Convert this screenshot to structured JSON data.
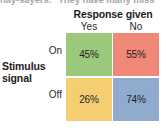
{
  "figure": {
    "clipped_top_text": "nay-sayers.\" They have many miss",
    "column_group_title": "Response given",
    "row_group_title_line1": "Stimulus",
    "row_group_title_line2": "signal",
    "column_labels": [
      "Yes",
      "No"
    ],
    "row_labels": [
      "On",
      "Off"
    ]
  },
  "chart_data": {
    "type": "heatmap",
    "title": "",
    "xlabel": "Response given",
    "ylabel": "Stimulus signal",
    "categories": [
      "Yes",
      "No"
    ],
    "rows": [
      "On",
      "Off"
    ],
    "grid": false,
    "legend": "none",
    "cells": [
      {
        "row": "On",
        "column": "Yes",
        "label": "45%",
        "value": 45,
        "color": "#9BC87A"
      },
      {
        "row": "On",
        "column": "No",
        "label": "55%",
        "value": 55,
        "color": "#F08878"
      },
      {
        "row": "Off",
        "column": "Yes",
        "label": "26%",
        "value": 26,
        "color": "#F5CE72"
      },
      {
        "row": "Off",
        "column": "No",
        "label": "74%",
        "value": 74,
        "color": "#8FABCE"
      }
    ],
    "series": [
      {
        "name": "On",
        "values": [
          45,
          55
        ]
      },
      {
        "name": "Off",
        "values": [
          26,
          74
        ]
      }
    ]
  }
}
